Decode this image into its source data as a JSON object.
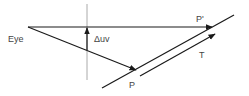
{
  "diagram": {
    "labels": {
      "eye": "Eye",
      "delta_uv": "Δuv",
      "p_prime": "P'",
      "t": "T",
      "p": "P"
    },
    "colors": {
      "line": "#1a1a1a",
      "guide": "#aaaaaa",
      "text": "#444444",
      "background": "#ffffff"
    }
  }
}
